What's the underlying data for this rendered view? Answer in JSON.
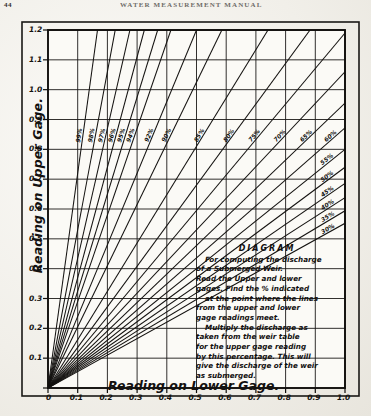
{
  "page": {
    "folio": "44",
    "running_head": "WATER MEASUREMENT MANUAL"
  },
  "figure": {
    "note_title": "DIAGRAM",
    "note_lines": [
      "For computing the discharge",
      "of a Submerged Weir.",
      "Read the Upper and lower",
      "gages. Find the % indicated",
      "at the point where the lines",
      "from the upper and lower",
      "gage readings meet.",
      "Multiply the discharge as",
      "taken from the weir table",
      "for the upper  gage reading",
      "by this percentage. This will",
      "give the discharge of the weir",
      "as submerged."
    ]
  },
  "chart_data": {
    "type": "line",
    "title": "DIAGRAM",
    "subtitle": "For computing the discharge of a Submerged Weir.",
    "xlabel": "Reading on Lower Gage.",
    "ylabel": "Reading on Upper Gage.",
    "xlim": [
      0,
      1.0
    ],
    "ylim": [
      0,
      1.2
    ],
    "xticks": [
      "0",
      "0.1",
      "0.2",
      "0.3",
      "0.4",
      "0.5",
      "0.6",
      "0.7",
      "0.8",
      "0.9",
      "1.0"
    ],
    "yticks": [
      "0",
      "0.1",
      "0.2",
      "0.3",
      "0.4",
      "0.5",
      "0.6",
      "0.7",
      "0.8",
      "0.9",
      "1.0",
      "1.1",
      "1.2"
    ],
    "grid": true,
    "legend": "none",
    "series_description": "Family of straight lines radiating from the origin; each line is a constant percentage of submerged-weir discharge. Label value = percent; line slope = upper-gage reading divided by lower-gage reading.",
    "series": [
      {
        "name": "99%",
        "label": "99%",
        "slope": 7.2
      },
      {
        "name": "98%",
        "label": "98%",
        "slope": 5.3
      },
      {
        "name": "97%",
        "label": "97%",
        "slope": 4.35
      },
      {
        "name": "96%",
        "label": "96%",
        "slope": 3.7
      },
      {
        "name": "95%",
        "label": "95%",
        "slope": 3.25
      },
      {
        "name": "94%",
        "label": "94%",
        "slope": 2.9
      },
      {
        "name": "92%",
        "label": "92%",
        "slope": 2.4
      },
      {
        "name": "90%",
        "label": "90%",
        "slope": 2.05
      },
      {
        "name": "85%",
        "label": "85%",
        "slope": 1.62
      },
      {
        "name": "80%",
        "label": "80%",
        "slope": 1.36
      },
      {
        "name": "75%",
        "label": "75%",
        "slope": 1.19
      },
      {
        "name": "70%",
        "label": "70%",
        "slope": 1.06
      },
      {
        "name": "65%",
        "label": "65%",
        "slope": 0.955
      },
      {
        "name": "60%",
        "label": "60%",
        "slope": 0.872
      },
      {
        "name": "55%",
        "label": "55%",
        "slope": 0.8
      },
      {
        "name": "50%",
        "label": "50%",
        "slope": 0.74
      },
      {
        "name": "45%",
        "label": "45%",
        "slope": 0.686
      },
      {
        "name": "40%",
        "label": "40%",
        "slope": 0.638
      },
      {
        "name": "35%",
        "label": "35%",
        "slope": 0.594
      },
      {
        "name": "30%",
        "label": "30%",
        "slope": 0.552
      }
    ]
  },
  "colors": {
    "ink": "#131110",
    "paper": "#f1efe9"
  }
}
